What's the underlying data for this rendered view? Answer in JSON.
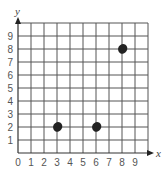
{
  "chart_data": {
    "type": "scatter",
    "title": "",
    "xlabel": "x",
    "ylabel": "y",
    "xlim": [
      0,
      10
    ],
    "ylim": [
      0,
      10
    ],
    "grid": true,
    "x_ticks": [
      "0",
      "1",
      "2",
      "3",
      "4",
      "5",
      "6",
      "7",
      "8",
      "9"
    ],
    "y_ticks": [
      "1",
      "2",
      "3",
      "4",
      "5",
      "6",
      "7",
      "8",
      "9"
    ],
    "series": [
      {
        "name": "points",
        "points": [
          {
            "x": 3,
            "y": 2
          },
          {
            "x": 6,
            "y": 2
          },
          {
            "x": 8,
            "y": 8
          }
        ]
      }
    ]
  },
  "colors": {
    "grid": "#555555",
    "point": "#222222",
    "text": "#555555"
  }
}
